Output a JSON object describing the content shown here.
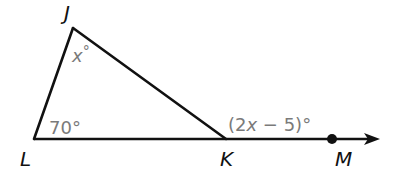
{
  "diagram": {
    "type": "triangle-exterior-angle",
    "vertices": {
      "J": {
        "label": "J",
        "x": 73,
        "y": 28
      },
      "L": {
        "label": "L",
        "x": 34,
        "y": 139
      },
      "K": {
        "label": "K",
        "x": 226,
        "y": 139
      }
    },
    "ray": {
      "from": "K",
      "through_point": {
        "label": "M",
        "x": 332,
        "y": 139
      },
      "arrow_tip": {
        "x": 378,
        "y": 139
      }
    },
    "angles": {
      "J": {
        "text_var": "x",
        "text_suffix": "°"
      },
      "L": {
        "text": "70°"
      },
      "exterior_K": {
        "text_open": "(2",
        "text_var": "x",
        "text_rest": " − 5)°"
      }
    },
    "colors": {
      "line": "#111111",
      "angle_text": "#7a7a7a",
      "vertex_text": "#111111"
    }
  }
}
